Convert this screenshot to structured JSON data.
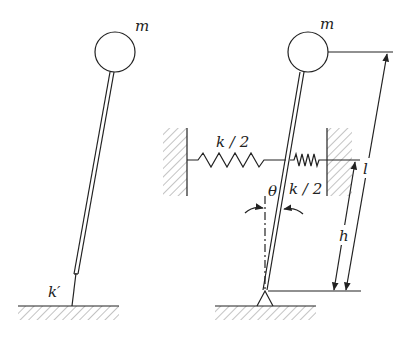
{
  "diagram": {
    "left_figure": {
      "mass_label": "m",
      "spring_label": "k′",
      "description": "Rigid rod with mass m on top, attached to ground through torsional spring k′"
    },
    "right_figure": {
      "mass_label": "m",
      "spring_left_label": "k / 2",
      "spring_right_label": "k / 2",
      "angle_label": "θ",
      "length_label": "l",
      "height_label": "h",
      "description": "Pinned inverted pendulum supported by two horizontal springs k/2 at height h; rod length l, tilt angle θ"
    },
    "colors": {
      "stroke": "#222222",
      "hatch": "#888888",
      "background": "#ffffff"
    }
  }
}
